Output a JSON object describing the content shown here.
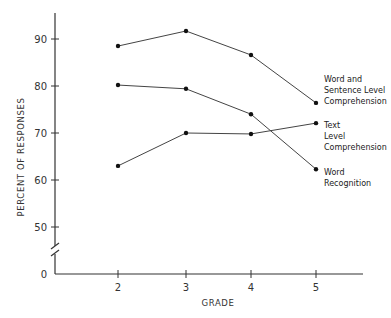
{
  "chart_data": {
    "type": "line",
    "title": "",
    "xlabel": "GRADE",
    "ylabel": "PERCENT OF RESPONSES",
    "x": [
      2,
      3,
      4,
      5
    ],
    "x_tick_labels": [
      "2",
      "3",
      "4",
      "5"
    ],
    "y_ticks": [
      0,
      50,
      60,
      70,
      80,
      90
    ],
    "y_tick_labels": [
      "0",
      "50",
      "60",
      "70",
      "80",
      "90"
    ],
    "ylim": [
      45,
      95
    ],
    "y_axis_break": "between 0 and 50",
    "grid": false,
    "legend": "direct labels at right end of lines",
    "series": [
      {
        "name": "Word and Sentence Level Comprehension",
        "label_lines": [
          "Word and",
          "Sentence Level",
          "Comprehension"
        ],
        "values": [
          88.5,
          91.7,
          86.6,
          76.4
        ]
      },
      {
        "name": "Text Level Comprehension",
        "label_lines": [
          "Text",
          "Level",
          "Comprehension"
        ],
        "values": [
          63.0,
          70.0,
          69.8,
          72.1
        ]
      },
      {
        "name": "Word Recognition",
        "label_lines": [
          "Word",
          "Recognition"
        ],
        "values": [
          80.2,
          79.4,
          74.0,
          62.3
        ]
      }
    ]
  }
}
